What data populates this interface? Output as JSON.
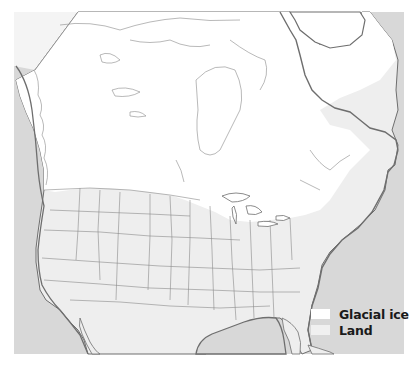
{
  "map": {
    "title": "North America during the last glacial maximum",
    "colors": {
      "ocean": "#d8d8d8",
      "land": "#eeeeee",
      "glacial_ice": "#ffffff",
      "coastline": "#6e6e6e",
      "borders": "#8a8a8a",
      "page_background": "#ffffff"
    },
    "regions": [
      "Canada (ice-covered)",
      "Greenland (ice-covered)",
      "United States",
      "Mexico",
      "Gulf of Mexico",
      "Atlantic Ocean",
      "Pacific Ocean"
    ]
  },
  "legend": {
    "items": [
      {
        "label": "Glacial ice",
        "color": "#ffffff"
      },
      {
        "label": "Land",
        "color": "#f0f0f0"
      }
    ]
  }
}
